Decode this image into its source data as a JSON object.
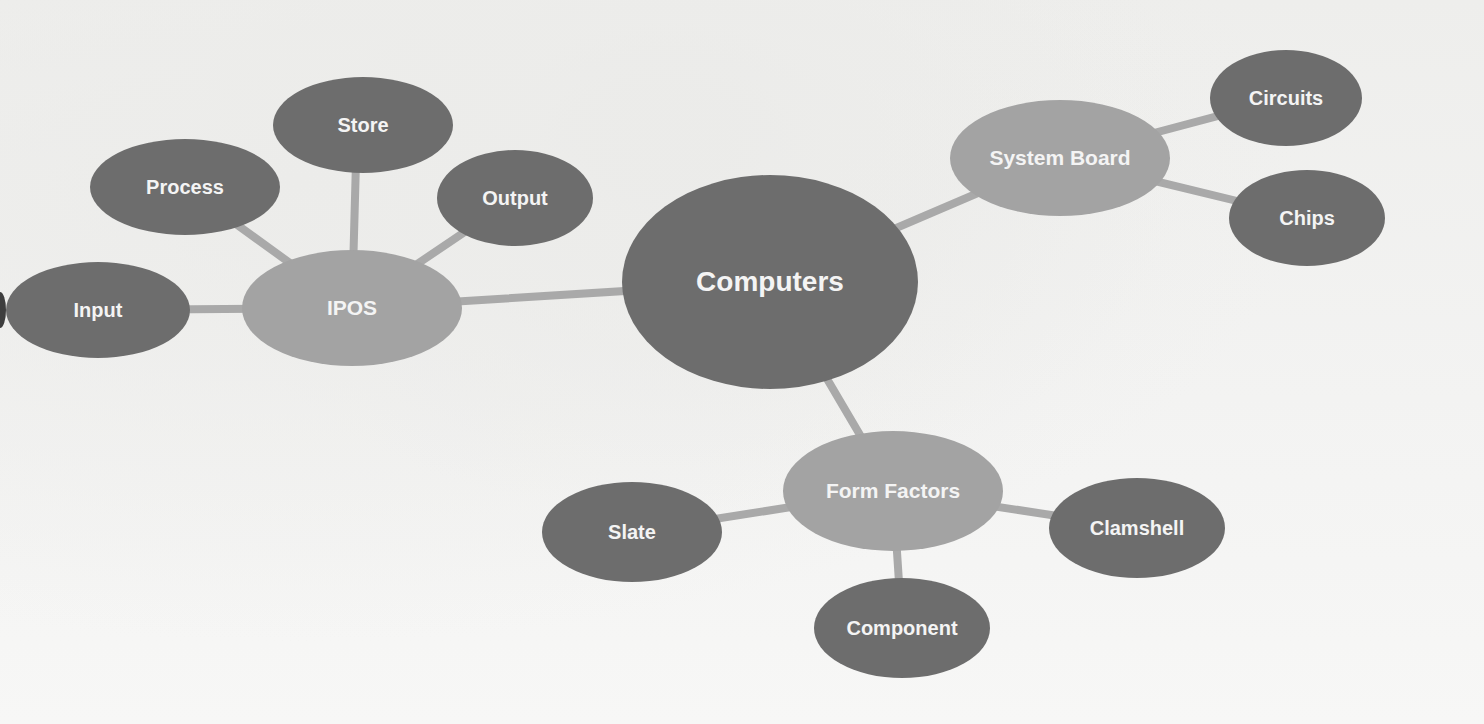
{
  "colors": {
    "background": "#f1f1f0",
    "root_node": "#6d6d6d",
    "hub_node": "#a3a3a3",
    "leaf_node": "#6d6d6d",
    "connector": "#a9a9a9",
    "label_text": "#f4f4f4"
  },
  "diagram": {
    "root": {
      "id": "computers",
      "label": "Computers"
    },
    "hubs": [
      {
        "id": "ipos",
        "label": "IPOS",
        "children": [
          "Input",
          "Process",
          "Store",
          "Output"
        ]
      },
      {
        "id": "system-board",
        "label": "System Board",
        "children": [
          "Circuits",
          "Chips"
        ]
      },
      {
        "id": "form-factors",
        "label": "Form Factors",
        "children": [
          "Slate",
          "Component",
          "Clamshell"
        ]
      }
    ]
  },
  "nodes": {
    "computers": "Computers",
    "ipos": "IPOS",
    "input": "Input",
    "process": "Process",
    "store": "Store",
    "output": "Output",
    "system_board": "System Board",
    "circuits": "Circuits",
    "chips": "Chips",
    "form_factors": "Form Factors",
    "slate": "Slate",
    "clamshell": "Clamshell",
    "component": "Component"
  }
}
